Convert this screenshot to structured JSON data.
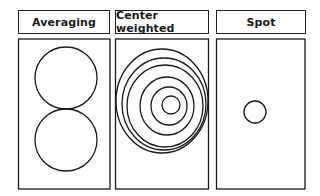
{
  "panels": [
    {
      "title": "Averaging",
      "description": "two large circles stacked vertically"
    },
    {
      "title": "Center weighted",
      "description": "concentric ellipses weighted toward center"
    },
    {
      "title": "Spot",
      "description": "single small circle in center"
    }
  ],
  "colors": {
    "stroke": "#1a1a1a",
    "background": "#ffffff"
  }
}
